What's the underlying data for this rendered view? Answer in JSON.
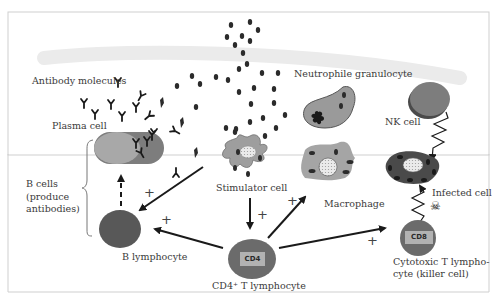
{
  "diagram": {
    "title": "",
    "labels": {
      "antibody_molecules": "Antibody molecules",
      "plasma_cell": "Plasma cell",
      "b_cells_group": [
        "B cells",
        "(produce",
        "antibodies)"
      ],
      "b_lymphocyte": "B lymphocyte",
      "stimulator_cell": "Stimulator cell",
      "cd4_t_lymphocyte": "CD4⁺ T lymphocyte",
      "neutrophile_granulocyte": "Neutrophile granulocyte",
      "macrophage": "Macrophage",
      "nk_cell": "NK cell",
      "infected_cell": "Infected cell",
      "cytotoxic_t_lymphocyte": [
        "Cytotoxic T lympho-",
        "cyte (killer cell)"
      ]
    },
    "badges": {
      "cd4": "CD4",
      "cd8": "CD8"
    },
    "signs": {
      "plus": "+"
    },
    "icons": {
      "skull": "☠"
    },
    "colors": {
      "cell_dark": "#5a5a5a",
      "cell_mid": "#8a8a8a",
      "cell_light": "#a9a9a9",
      "badge_fill": "#b5b5b5",
      "band": "#ececec",
      "granule": "#2b2b2b",
      "frame": "#c9c9c9"
    },
    "connections": [
      {
        "from": "Stimulator cell",
        "to": "B lymphocyte",
        "sign": "+"
      },
      {
        "from": "Stimulator cell",
        "to": "CD4+ T lymphocyte",
        "sign": "+"
      },
      {
        "from": "CD4+ T lymphocyte",
        "to": "B lymphocyte",
        "sign": "+"
      },
      {
        "from": "CD4+ T lymphocyte",
        "to": "Macrophage",
        "sign": "+"
      },
      {
        "from": "CD4+ T lymphocyte",
        "to": "Cytotoxic T lymphocyte",
        "sign": "+"
      },
      {
        "from": "B lymphocyte",
        "to": "Plasma cell",
        "style": "dashed"
      },
      {
        "from": "NK cell",
        "to": "Infected cell",
        "style": "zigzag"
      },
      {
        "from": "Cytotoxic T lymphocyte",
        "to": "Infected cell",
        "style": "zigzag"
      }
    ]
  }
}
